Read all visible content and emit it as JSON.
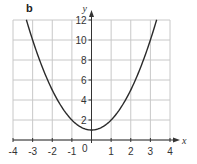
{
  "panel_label": "b",
  "chart_data": {
    "type": "line",
    "title": "",
    "function": "y = x^2 + 1",
    "xlabel": "x",
    "ylabel": "y",
    "xlim": [
      -4,
      4
    ],
    "ylim": [
      0,
      12
    ],
    "x_ticks": [
      -4,
      -3,
      -2,
      -1,
      0,
      1,
      2,
      3,
      4
    ],
    "y_ticks": [
      2,
      4,
      6,
      8,
      10,
      12
    ],
    "grid": true,
    "legend": null,
    "series": [
      {
        "name": "y = x^2 + 1",
        "x": [
          -3.32,
          -3,
          -2.5,
          -2,
          -1.5,
          -1,
          -0.5,
          0,
          0.5,
          1,
          1.5,
          2,
          2.5,
          3,
          3.32
        ],
        "values": [
          12,
          10,
          7.25,
          5,
          3.25,
          2,
          1.25,
          1,
          1.25,
          2,
          3.25,
          5,
          7.25,
          10,
          12
        ]
      }
    ],
    "origin_label": "0"
  },
  "colors": {
    "grid": "#c8c8c8",
    "axis": "#333333",
    "curve": "#2a2a2a",
    "text": "#333333"
  }
}
